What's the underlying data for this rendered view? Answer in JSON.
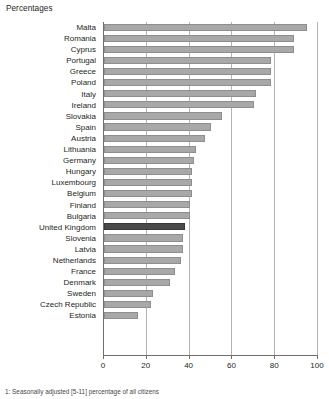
{
  "chart": {
    "title": "Percentages",
    "footnote": "1: Seasonally adjusted [5-11] percentage of all citizens"
  },
  "axis": {
    "ticks": [
      "0",
      "20",
      "40",
      "60",
      "80",
      "100"
    ]
  },
  "colors": {
    "bar": "#a8a8a8",
    "highlight": "#4a4a4a",
    "grid": "#b4b4b4",
    "axis": "#6e6e6e",
    "text": "#231f20"
  },
  "chart_data": {
    "type": "bar",
    "orientation": "horizontal",
    "title": "Percentages",
    "xlabel": "",
    "ylabel": "",
    "xlim": [
      0,
      100
    ],
    "xticks": [
      0,
      20,
      40,
      60,
      80,
      100
    ],
    "grid": true,
    "legend": null,
    "highlight_category": "United Kingdom",
    "categories": [
      "Malta",
      "Romania",
      "Cyprus",
      "Portugal",
      "Greece",
      "Poland",
      "Italy",
      "Ireland",
      "Slovakia",
      "Spain",
      "Austria",
      "Lithuania",
      "Germany",
      "Hungary",
      "Luxembourg",
      "Belgium",
      "Finland",
      "Bulgaria",
      "United Kingdom",
      "Slovenia",
      "Latvia",
      "Netherlands",
      "France",
      "Denmark",
      "Sweden",
      "Czech Republic",
      "Estonia"
    ],
    "values": [
      95,
      89,
      89,
      78,
      78,
      78,
      71,
      70,
      55,
      50,
      47,
      43,
      42,
      41,
      41,
      41,
      40,
      40,
      38,
      37,
      37,
      36,
      33,
      31,
      23,
      22,
      16
    ]
  }
}
